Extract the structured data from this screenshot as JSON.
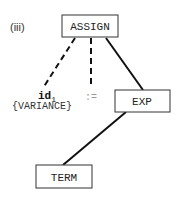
{
  "diagram": {
    "label": "(iii)",
    "nodes": {
      "assign": {
        "label": "ASSIGN"
      },
      "exp": {
        "label": "EXP"
      },
      "term": {
        "label": "TERM"
      }
    },
    "leaves": {
      "id": {
        "label": "id",
        "subscript": "1",
        "annotation": "{VARIANCE}"
      },
      "op": {
        "label": ":="
      }
    },
    "edges": [
      {
        "from": "ASSIGN",
        "to": "id1",
        "style": "dashed"
      },
      {
        "from": "ASSIGN",
        "to": ":=",
        "style": "dashed"
      },
      {
        "from": "ASSIGN",
        "to": "EXP",
        "style": "solid"
      },
      {
        "from": "EXP",
        "to": "TERM",
        "style": "solid"
      }
    ],
    "colors": {
      "stroke": "#111111",
      "text": "#222222",
      "faint_text": "#999999"
    }
  }
}
